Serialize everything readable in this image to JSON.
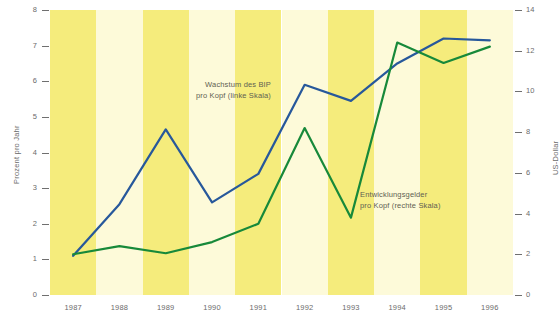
{
  "chart_data": {
    "type": "line",
    "title": "",
    "xlabel": "",
    "categories": [
      "1987",
      "1988",
      "1989",
      "1990",
      "1991",
      "1992",
      "1993",
      "1994",
      "1995",
      "1996"
    ],
    "grid": false,
    "legend_position": "inline-annotation",
    "axes": {
      "left": {
        "title": "Prozent pro Jahr",
        "min": 0,
        "max": 8,
        "step": 1,
        "ticks": [
          "0",
          "1",
          "2",
          "3",
          "4",
          "5",
          "6",
          "7",
          "8"
        ]
      },
      "right": {
        "title": "US-Dollar",
        "min": 0,
        "max": 14,
        "step": 2,
        "ticks": [
          "0",
          "2",
          "4",
          "6",
          "8",
          "10",
          "12",
          "14"
        ]
      }
    },
    "series": [
      {
        "name": "Wachstum des BIP pro Kopf (linke Skala)",
        "axis": "left",
        "color": "#27589b",
        "annotation_line1": "Wachstum des BIP",
        "annotation_line2": "pro Kopf (linke Skala)",
        "values": [
          1.1,
          2.55,
          4.65,
          2.6,
          3.4,
          5.9,
          5.45,
          6.5,
          7.2,
          7.15
        ]
      },
      {
        "name": "Entwicklungsgelder pro Kopf (rechte Skala)",
        "axis": "right",
        "color": "#17893a",
        "annotation_line1": "Entwicklungsgelder",
        "annotation_line2": "pro Kopf (rechte Skala)",
        "values": [
          2.0,
          2.4,
          2.05,
          2.6,
          3.5,
          8.2,
          3.8,
          12.4,
          11.4,
          12.2
        ]
      }
    ],
    "colors": {
      "stripe_dark": "#f5ec7c",
      "stripe_light": "#fdfad9",
      "axis_text": "#6b6b6b",
      "annotation_text": "#5f5f52",
      "background": "#ffffff"
    }
  }
}
